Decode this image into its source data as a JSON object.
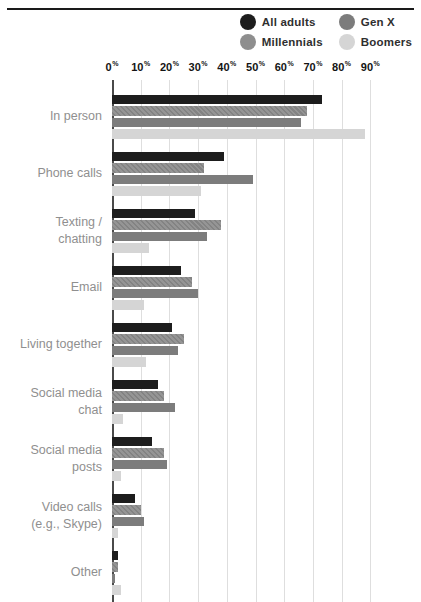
{
  "legend": {
    "items": [
      {
        "label": "All adults",
        "color": "#1d1d1d"
      },
      {
        "label": "Gen X",
        "color": "#7c7c7c"
      },
      {
        "label": "Millennials",
        "color": "#8e8e8e"
      },
      {
        "label": "Boomers",
        "color": "#d5d5d5"
      }
    ]
  },
  "chart_data": {
    "type": "bar",
    "orientation": "horizontal",
    "title": "",
    "xlabel": "",
    "ylabel": "",
    "axis": {
      "ticks": [
        "0",
        "10",
        "20",
        "30",
        "40",
        "50",
        "60",
        "70",
        "80",
        "90"
      ],
      "unit": "%",
      "min": 0,
      "max": 90,
      "grid": true,
      "grid_color": "#dedede",
      "zero_line_color": "#4a4a4a"
    },
    "categories": [
      "In person",
      "Phone calls",
      "Texting / chatting",
      "Email",
      "Living together",
      "Social media chat",
      "Social media posts",
      "Video calls (e.g., Skype)",
      "Other"
    ],
    "series": [
      {
        "name": "All adults",
        "color": "#1d1d1d",
        "hatched": false,
        "values": [
          73,
          39,
          29,
          24,
          21,
          16,
          14,
          8,
          2
        ]
      },
      {
        "name": "Millennials",
        "color": "#8e8e8e",
        "hatched": true,
        "values": [
          68,
          32,
          38,
          28,
          25,
          18,
          18,
          10,
          2
        ]
      },
      {
        "name": "Gen X",
        "color": "#7c7c7c",
        "hatched": false,
        "values": [
          66,
          49,
          33,
          30,
          23,
          22,
          19,
          11,
          1
        ]
      },
      {
        "name": "Boomers",
        "color": "#d5d5d5",
        "hatched": false,
        "values": [
          88,
          31,
          13,
          11,
          12,
          4,
          3,
          2,
          3
        ]
      }
    ],
    "legend_display_order": [
      "All adults",
      "Gen X",
      "Millennials",
      "Boomers"
    ]
  }
}
